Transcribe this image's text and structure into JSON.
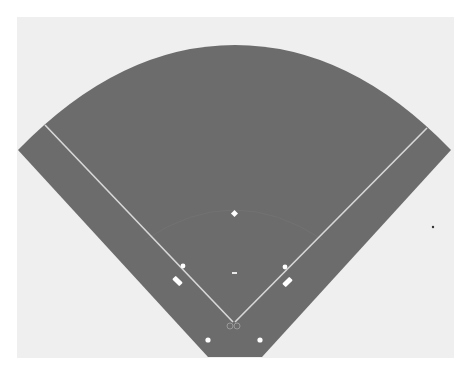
{
  "caption": {
    "text": "ng up",
    "note": "partially cropped text at top edge"
  },
  "colors": {
    "page_background": "#ffffff",
    "panel_background": "#efefef",
    "field": "#6c6c6c",
    "lines": "#d8d8d8",
    "markers": "#ffffff",
    "stray_dot": "#333333"
  },
  "diagram": {
    "elements": [
      {
        "id": "outfield",
        "label": "Outfield fence arc"
      },
      {
        "id": "foul-line-left",
        "label": "Third base foul line"
      },
      {
        "id": "foul-line-right",
        "label": "First base foul line"
      },
      {
        "id": "second-base",
        "label": "Second base"
      },
      {
        "id": "third-base",
        "label": "Third base"
      },
      {
        "id": "first-base",
        "label": "First base"
      },
      {
        "id": "pitchers-mound",
        "label": "Pitcher's rubber"
      },
      {
        "id": "home-plate",
        "label": "Home plate / batter's boxes"
      },
      {
        "id": "coach-box-left",
        "label": "Third base coach box"
      },
      {
        "id": "coach-box-right",
        "label": "First base coach box"
      },
      {
        "id": "on-deck-left",
        "label": "On-deck circle left"
      },
      {
        "id": "on-deck-right",
        "label": "On-deck circle right"
      }
    ]
  }
}
